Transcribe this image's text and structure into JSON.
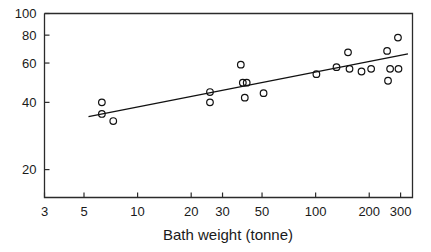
{
  "chart_data": {
    "type": "scatter",
    "title": "",
    "xlabel": "Bath weight (tonne)",
    "ylabel": "",
    "xscale": "log",
    "yscale": "log",
    "xlim": [
      3,
      350
    ],
    "ylim": [
      15,
      100
    ],
    "grid": false,
    "legend": false,
    "xticks": [
      3,
      5,
      10,
      20,
      30,
      50,
      100,
      200,
      300
    ],
    "xtick_labels": [
      "3",
      "5",
      "10",
      "20",
      "30",
      "50",
      "100",
      "200",
      "300"
    ],
    "yticks": [
      20,
      40,
      60,
      80,
      100
    ],
    "ytick_labels": [
      "20",
      "40",
      "60",
      "80",
      "100"
    ],
    "marker": "open-circle",
    "points": [
      {
        "x": 6.3,
        "y": 40.0
      },
      {
        "x": 6.3,
        "y": 35.5
      },
      {
        "x": 7.3,
        "y": 33.0
      },
      {
        "x": 25.5,
        "y": 44.5
      },
      {
        "x": 25.5,
        "y": 40.0
      },
      {
        "x": 38.0,
        "y": 59.0
      },
      {
        "x": 39.0,
        "y": 49.0
      },
      {
        "x": 41.0,
        "y": 49.0
      },
      {
        "x": 40.0,
        "y": 42.0
      },
      {
        "x": 51.0,
        "y": 44.0
      },
      {
        "x": 101.0,
        "y": 53.5
      },
      {
        "x": 131.0,
        "y": 57.5
      },
      {
        "x": 152.0,
        "y": 67.0
      },
      {
        "x": 155.0,
        "y": 56.5
      },
      {
        "x": 181.0,
        "y": 55.0
      },
      {
        "x": 205.0,
        "y": 56.5
      },
      {
        "x": 252.0,
        "y": 68.0
      },
      {
        "x": 255.0,
        "y": 50.0
      },
      {
        "x": 262.0,
        "y": 56.5
      },
      {
        "x": 290.0,
        "y": 78.0
      },
      {
        "x": 292.0,
        "y": 56.5
      }
    ],
    "fit_line": {
      "name": "regression-line",
      "x_start": 5.3,
      "y_start": 34.5,
      "x_end": 330.0,
      "y_end": 66.0
    }
  },
  "axes": {
    "x_title": "Bath weight (tonne)"
  }
}
